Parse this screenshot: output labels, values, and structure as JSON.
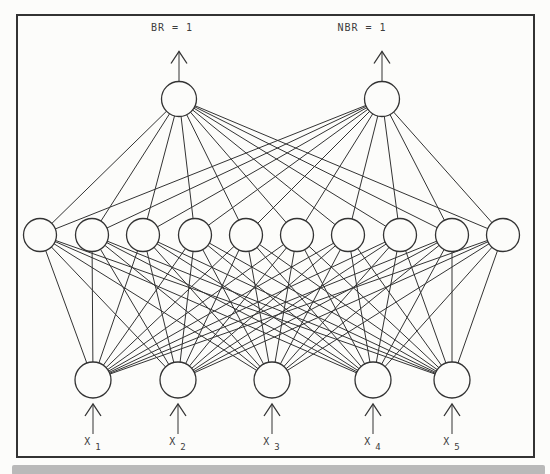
{
  "figure": {
    "type": "feedforward-neural-network-diagram",
    "top_labels": [
      {
        "text": "BR = 1",
        "x": 172,
        "y": 22
      },
      {
        "text": "NBR = 1",
        "x": 362,
        "y": 22
      }
    ],
    "network": {
      "output_layer": {
        "y": 99,
        "r": 17.5,
        "x": [
          179,
          382
        ]
      },
      "hidden_layer": {
        "y": 235,
        "r": 16.5,
        "x": [
          40,
          92,
          143,
          195,
          246,
          297,
          348,
          400,
          452,
          503
        ]
      },
      "input_layer": {
        "y": 380,
        "r": 18,
        "x": [
          93,
          178,
          272,
          373,
          452
        ]
      },
      "input_labels": [
        {
          "base": "X",
          "sub": "1"
        },
        {
          "base": "X",
          "sub": "2"
        },
        {
          "base": "X",
          "sub": "3"
        },
        {
          "base": "X",
          "sub": "4"
        },
        {
          "base": "X",
          "sub": "5"
        }
      ],
      "connectivity": "fully connected between adjacent layers"
    },
    "colors": {
      "background": "#fcfcfa",
      "ink": "#333333",
      "frame": "#333333",
      "text": "#3d3d3d",
      "node_fill": "#fcfcfa",
      "bottom_bar": "#b9b9b9"
    }
  }
}
